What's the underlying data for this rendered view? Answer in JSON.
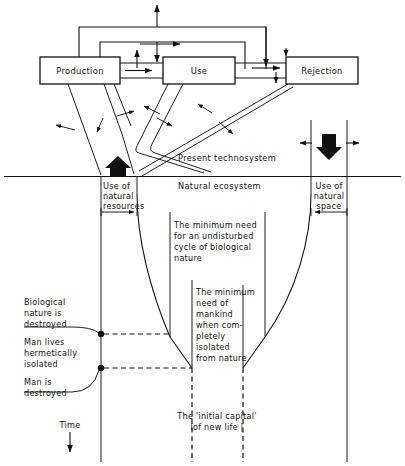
{
  "figure": {
    "type": "flow-diagram",
    "title_present": false,
    "boxes": [
      {
        "id": "production",
        "label": "Production"
      },
      {
        "id": "use",
        "label": "Use"
      },
      {
        "id": "rejection",
        "label": "Rejection"
      }
    ],
    "zones": [
      {
        "id": "technosystem",
        "label": "Present technosystem"
      },
      {
        "id": "ecosystem",
        "label": "Natural ecosystem"
      }
    ],
    "span_labels": [
      {
        "id": "use-of-natural-resources",
        "lines": [
          "Use of",
          "natural",
          "resources"
        ]
      },
      {
        "id": "use-of-natural-space",
        "lines": [
          "Use of",
          "natural",
          "space"
        ]
      }
    ],
    "annotations": [
      {
        "id": "min-need-undisturbed-cycle",
        "lines": [
          "The minimum need",
          "for an undisturbed",
          "cycle of biological",
          "nature"
        ]
      },
      {
        "id": "min-need-mankind-isolated",
        "lines": [
          "The minimum",
          "need of",
          "mankind",
          "when com-",
          "pletely",
          "isolated",
          "from nature"
        ]
      },
      {
        "id": "initial-capital-new-life",
        "lines": [
          "The 'initial capital'",
          "lof new life |"
        ]
      }
    ],
    "event_markers": [
      {
        "id": "biological-nature-destroyed",
        "lines": [
          "Biological",
          "nature is",
          "destroyed"
        ]
      },
      {
        "id": "man-lives-hermetically-isolated",
        "lines": [
          "Man lives",
          "hermetically",
          "isolated"
        ]
      },
      {
        "id": "man-is-destroyed",
        "lines": [
          "Man is",
          "destroyed"
        ]
      }
    ],
    "axis": {
      "id": "time-axis",
      "label": "Time",
      "direction": "down"
    },
    "colors": {
      "ink": "#111111",
      "paper": "#ffffff"
    }
  }
}
